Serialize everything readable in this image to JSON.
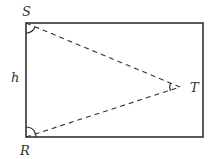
{
  "diagram": {
    "type": "geometry",
    "labels": {
      "S": "S",
      "R": "R",
      "T": "T",
      "h": "h"
    },
    "points": {
      "S": [
        26,
        23
      ],
      "R": [
        26,
        137
      ],
      "T": [
        180,
        87
      ]
    },
    "rectangle": {
      "x": 26,
      "y": 23,
      "width": 177,
      "height": 114
    },
    "colors": {
      "stroke": "#333333",
      "background": "#ffffff"
    }
  }
}
